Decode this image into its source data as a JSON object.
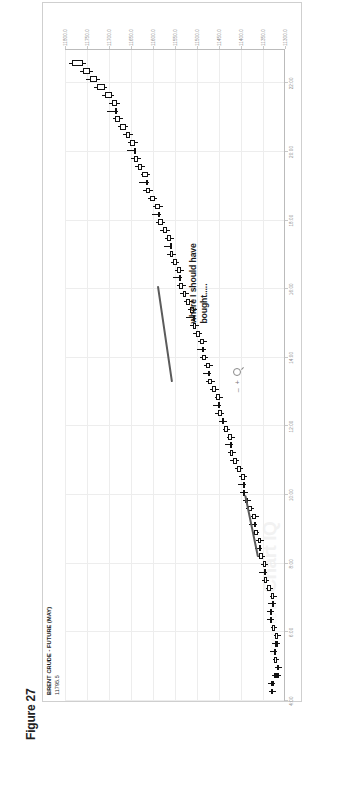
{
  "page": {
    "header_note": "chart research note"
  },
  "figure": {
    "caption": "Figure 27"
  },
  "chart_header": {
    "symbol_name": "BRENT CRUDE - FUTURE (MAY)",
    "last_price": "11795.5"
  },
  "watermark": {
    "brand": "Chart IQ",
    "sub": "POWERED BY"
  },
  "annotation": {
    "text": "where I should have\nbought....."
  },
  "zoom_controls": {
    "zoom_out_label": "–",
    "zoom_in_label": "+",
    "magnifier_icon": "magnifier-icon"
  },
  "chart_data": {
    "type": "candlestick",
    "title": "BRENT CRUDE - FUTURE (MAY)",
    "subtitle": "11795.5",
    "xlabel": "",
    "ylabel": "",
    "grid": true,
    "legend": "none",
    "xlim": [
      4.0,
      23.0
    ],
    "ylim": [
      11300.0,
      11800.0
    ],
    "x_tick_labels": [
      "4:00",
      "6:00",
      "8:00",
      "10:00",
      "12:00",
      "14:00",
      "16:00",
      "18:00",
      "20:00",
      "22:00"
    ],
    "x_tick_values": [
      4,
      6,
      8,
      10,
      12,
      14,
      16,
      18,
      20,
      22
    ],
    "y_tick_labels": [
      "11800.0",
      "11750.0",
      "11700.0",
      "11650.0",
      "11600.0",
      "11550.0",
      "11500.0",
      "11450.0",
      "11400.0",
      "11350.0",
      "11300.0"
    ],
    "y_tick_values": [
      11800,
      11750,
      11700,
      11650,
      11600,
      11550,
      11500,
      11450,
      11400,
      11350,
      11300
    ],
    "annotations": [
      {
        "text": "where I should have bought.....",
        "x": 15.0,
        "y": 11520
      }
    ],
    "trendlines": [
      {
        "name": "upper-downtrend",
        "x1": 13.3,
        "y1": 11560,
        "x2": 16.1,
        "y2": 11592
      },
      {
        "name": "lower-uptrend",
        "x1": 8.2,
        "y1": 11363,
        "x2": 10.0,
        "y2": 11392
      }
    ],
    "candles": [
      {
        "t": "4:05",
        "o": 11328,
        "h": 11336,
        "l": 11320,
        "c": 11331,
        "dir": "up"
      },
      {
        "t": "4:15",
        "o": 11331,
        "h": 11338,
        "l": 11322,
        "c": 11324,
        "dir": "down"
      },
      {
        "t": "4:25",
        "o": 11324,
        "h": 11330,
        "l": 11310,
        "c": 11314,
        "dir": "down"
      },
      {
        "t": "4:35",
        "o": 11314,
        "h": 11322,
        "l": 11306,
        "c": 11319,
        "dir": "up"
      },
      {
        "t": "4:45",
        "o": 11319,
        "h": 11328,
        "l": 11314,
        "c": 11326,
        "dir": "up"
      },
      {
        "t": "4:55",
        "o": 11326,
        "h": 11334,
        "l": 11318,
        "c": 11322,
        "dir": "down"
      },
      {
        "t": "5:05",
        "o": 11322,
        "h": 11330,
        "l": 11312,
        "c": 11316,
        "dir": "down"
      },
      {
        "t": "5:15",
        "o": 11316,
        "h": 11326,
        "l": 11310,
        "c": 11323,
        "dir": "up"
      },
      {
        "t": "5:25",
        "o": 11323,
        "h": 11332,
        "l": 11318,
        "c": 11329,
        "dir": "up"
      },
      {
        "t": "5:35",
        "o": 11329,
        "h": 11340,
        "l": 11324,
        "c": 11334,
        "dir": "up"
      },
      {
        "t": "5:45",
        "o": 11334,
        "h": 11342,
        "l": 11326,
        "c": 11330,
        "dir": "down"
      },
      {
        "t": "6:00",
        "o": 11330,
        "h": 11338,
        "l": 11320,
        "c": 11324,
        "dir": "down"
      },
      {
        "t": "6:15",
        "o": 11324,
        "h": 11334,
        "l": 11318,
        "c": 11331,
        "dir": "up"
      },
      {
        "t": "6:30",
        "o": 11331,
        "h": 11344,
        "l": 11328,
        "c": 11340,
        "dir": "up"
      },
      {
        "t": "6:45",
        "o": 11340,
        "h": 11352,
        "l": 11336,
        "c": 11348,
        "dir": "up"
      },
      {
        "t": "7:00",
        "o": 11348,
        "h": 11358,
        "l": 11342,
        "c": 11344,
        "dir": "down"
      },
      {
        "t": "7:15",
        "o": 11344,
        "h": 11354,
        "l": 11338,
        "c": 11351,
        "dir": "up"
      },
      {
        "t": "7:30",
        "o": 11351,
        "h": 11362,
        "l": 11346,
        "c": 11358,
        "dir": "up"
      },
      {
        "t": "7:45",
        "o": 11358,
        "h": 11368,
        "l": 11352,
        "c": 11355,
        "dir": "down"
      },
      {
        "t": "8:00",
        "o": 11355,
        "h": 11366,
        "l": 11348,
        "c": 11362,
        "dir": "up"
      },
      {
        "t": "8:15",
        "o": 11362,
        "h": 11374,
        "l": 11358,
        "c": 11370,
        "dir": "up"
      },
      {
        "t": "8:30",
        "o": 11370,
        "h": 11382,
        "l": 11364,
        "c": 11366,
        "dir": "down"
      },
      {
        "t": "8:45",
        "o": 11366,
        "h": 11378,
        "l": 11360,
        "c": 11375,
        "dir": "up"
      },
      {
        "t": "9:00",
        "o": 11375,
        "h": 11388,
        "l": 11370,
        "c": 11384,
        "dir": "up"
      },
      {
        "t": "9:15",
        "o": 11384,
        "h": 11396,
        "l": 11378,
        "c": 11390,
        "dir": "up"
      },
      {
        "t": "9:30",
        "o": 11390,
        "h": 11402,
        "l": 11384,
        "c": 11395,
        "dir": "up"
      },
      {
        "t": "9:45",
        "o": 11395,
        "h": 11406,
        "l": 11388,
        "c": 11392,
        "dir": "down"
      },
      {
        "t": "10:00",
        "o": 11392,
        "h": 11404,
        "l": 11386,
        "c": 11400,
        "dir": "up"
      },
      {
        "t": "10:15",
        "o": 11400,
        "h": 11414,
        "l": 11396,
        "c": 11410,
        "dir": "up"
      },
      {
        "t": "10:30",
        "o": 11410,
        "h": 11424,
        "l": 11404,
        "c": 11418,
        "dir": "up"
      },
      {
        "t": "10:45",
        "o": 11418,
        "h": 11430,
        "l": 11412,
        "c": 11424,
        "dir": "up"
      },
      {
        "t": "11:00",
        "o": 11424,
        "h": 11436,
        "l": 11418,
        "c": 11420,
        "dir": "down"
      },
      {
        "t": "11:15",
        "o": 11420,
        "h": 11432,
        "l": 11414,
        "c": 11429,
        "dir": "up"
      },
      {
        "t": "11:30",
        "o": 11429,
        "h": 11442,
        "l": 11424,
        "c": 11438,
        "dir": "up"
      },
      {
        "t": "11:45",
        "o": 11438,
        "h": 11450,
        "l": 11432,
        "c": 11444,
        "dir": "up"
      },
      {
        "t": "12:00",
        "o": 11444,
        "h": 11458,
        "l": 11438,
        "c": 11452,
        "dir": "up"
      },
      {
        "t": "12:15",
        "o": 11452,
        "h": 11464,
        "l": 11446,
        "c": 11448,
        "dir": "down"
      },
      {
        "t": "12:30",
        "o": 11448,
        "h": 11460,
        "l": 11442,
        "c": 11456,
        "dir": "up"
      },
      {
        "t": "12:45",
        "o": 11456,
        "h": 11470,
        "l": 11450,
        "c": 11466,
        "dir": "up"
      },
      {
        "t": "13:00",
        "o": 11466,
        "h": 11480,
        "l": 11460,
        "c": 11474,
        "dir": "up"
      },
      {
        "t": "13:15",
        "o": 11474,
        "h": 11486,
        "l": 11468,
        "c": 11470,
        "dir": "down"
      },
      {
        "t": "13:30",
        "o": 11470,
        "h": 11484,
        "l": 11464,
        "c": 11480,
        "dir": "up"
      },
      {
        "t": "13:45",
        "o": 11480,
        "h": 11494,
        "l": 11474,
        "c": 11488,
        "dir": "up"
      },
      {
        "t": "14:00",
        "o": 11488,
        "h": 11500,
        "l": 11480,
        "c": 11484,
        "dir": "down"
      },
      {
        "t": "14:15",
        "o": 11484,
        "h": 11498,
        "l": 11478,
        "c": 11494,
        "dir": "up"
      },
      {
        "t": "14:30",
        "o": 11494,
        "h": 11508,
        "l": 11488,
        "c": 11502,
        "dir": "up"
      },
      {
        "t": "14:45",
        "o": 11502,
        "h": 11516,
        "l": 11496,
        "c": 11510,
        "dir": "up"
      },
      {
        "t": "15:00",
        "o": 11510,
        "h": 11524,
        "l": 11504,
        "c": 11506,
        "dir": "down"
      },
      {
        "t": "15:15",
        "o": 11506,
        "h": 11520,
        "l": 11500,
        "c": 11516,
        "dir": "up"
      },
      {
        "t": "15:30",
        "o": 11516,
        "h": 11530,
        "l": 11510,
        "c": 11524,
        "dir": "up"
      },
      {
        "t": "15:45",
        "o": 11524,
        "h": 11538,
        "l": 11518,
        "c": 11532,
        "dir": "up"
      },
      {
        "t": "16:00",
        "o": 11532,
        "h": 11546,
        "l": 11526,
        "c": 11540,
        "dir": "up"
      },
      {
        "t": "16:15",
        "o": 11540,
        "h": 11554,
        "l": 11534,
        "c": 11536,
        "dir": "down"
      },
      {
        "t": "16:30",
        "o": 11536,
        "h": 11550,
        "l": 11530,
        "c": 11546,
        "dir": "up"
      },
      {
        "t": "16:45",
        "o": 11546,
        "h": 11560,
        "l": 11540,
        "c": 11554,
        "dir": "up"
      },
      {
        "t": "17:00",
        "o": 11554,
        "h": 11568,
        "l": 11548,
        "c": 11562,
        "dir": "up"
      },
      {
        "t": "17:15",
        "o": 11562,
        "h": 11576,
        "l": 11556,
        "c": 11558,
        "dir": "down"
      },
      {
        "t": "17:30",
        "o": 11558,
        "h": 11572,
        "l": 11552,
        "c": 11568,
        "dir": "up"
      },
      {
        "t": "17:45",
        "o": 11568,
        "h": 11584,
        "l": 11562,
        "c": 11578,
        "dir": "up"
      },
      {
        "t": "18:00",
        "o": 11578,
        "h": 11594,
        "l": 11572,
        "c": 11588,
        "dir": "up"
      },
      {
        "t": "18:15",
        "o": 11588,
        "h": 11602,
        "l": 11582,
        "c": 11584,
        "dir": "down"
      },
      {
        "t": "18:30",
        "o": 11584,
        "h": 11600,
        "l": 11578,
        "c": 11596,
        "dir": "up"
      },
      {
        "t": "18:45",
        "o": 11596,
        "h": 11612,
        "l": 11590,
        "c": 11606,
        "dir": "up"
      },
      {
        "t": "19:00",
        "o": 11606,
        "h": 11622,
        "l": 11600,
        "c": 11616,
        "dir": "up"
      },
      {
        "t": "19:15",
        "o": 11616,
        "h": 11632,
        "l": 11610,
        "c": 11612,
        "dir": "down"
      },
      {
        "t": "19:30",
        "o": 11612,
        "h": 11628,
        "l": 11606,
        "c": 11624,
        "dir": "up"
      },
      {
        "t": "19:45",
        "o": 11624,
        "h": 11640,
        "l": 11618,
        "c": 11634,
        "dir": "up"
      },
      {
        "t": "20:00",
        "o": 11634,
        "h": 11650,
        "l": 11628,
        "c": 11644,
        "dir": "up"
      },
      {
        "t": "20:15",
        "o": 11644,
        "h": 11660,
        "l": 11638,
        "c": 11640,
        "dir": "down"
      },
      {
        "t": "20:30",
        "o": 11640,
        "h": 11656,
        "l": 11634,
        "c": 11652,
        "dir": "up"
      },
      {
        "t": "20:45",
        "o": 11652,
        "h": 11668,
        "l": 11646,
        "c": 11662,
        "dir": "up"
      },
      {
        "t": "21:00",
        "o": 11662,
        "h": 11680,
        "l": 11656,
        "c": 11674,
        "dir": "up"
      },
      {
        "t": "21:15",
        "o": 11674,
        "h": 11692,
        "l": 11668,
        "c": 11686,
        "dir": "up"
      },
      {
        "t": "21:30",
        "o": 11686,
        "h": 11704,
        "l": 11680,
        "c": 11682,
        "dir": "down"
      },
      {
        "t": "21:45",
        "o": 11682,
        "h": 11700,
        "l": 11676,
        "c": 11694,
        "dir": "up"
      },
      {
        "t": "22:00",
        "o": 11694,
        "h": 11716,
        "l": 11688,
        "c": 11710,
        "dir": "up"
      },
      {
        "t": "22:15",
        "o": 11710,
        "h": 11734,
        "l": 11704,
        "c": 11728,
        "dir": "up"
      },
      {
        "t": "22:30",
        "o": 11728,
        "h": 11752,
        "l": 11720,
        "c": 11744,
        "dir": "up"
      },
      {
        "t": "22:45",
        "o": 11744,
        "h": 11766,
        "l": 11736,
        "c": 11758,
        "dir": "up"
      },
      {
        "t": "22:55",
        "o": 11758,
        "h": 11790,
        "l": 11752,
        "c": 11784,
        "dir": "up"
      }
    ]
  }
}
